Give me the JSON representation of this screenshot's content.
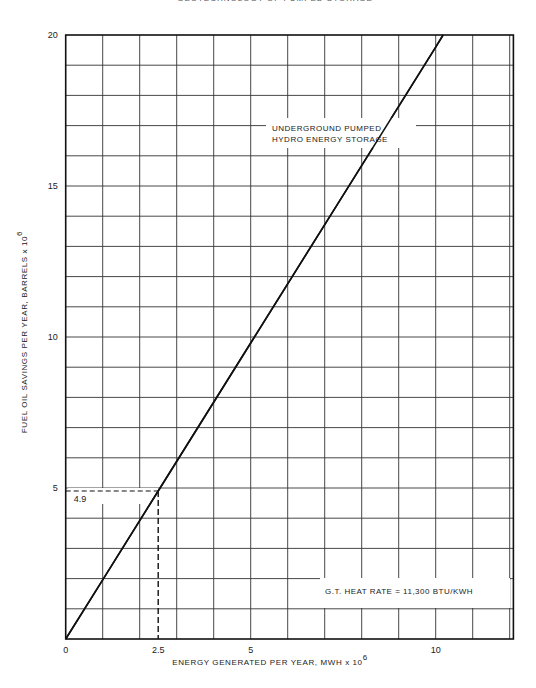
{
  "page": {
    "header": "GEOTECHNOLOGY OF PUMPED STORAGE"
  },
  "chart_data": {
    "type": "line",
    "title": "",
    "xlabel": "ENERGY GENERATED PER YEAR, MWH x 10",
    "xlabel_exp": "6",
    "ylabel": "FUEL OIL SAVINGS PER YEAR, BARRELS x 10",
    "ylabel_exp": "6",
    "xlim": [
      0,
      12.1
    ],
    "ylim": [
      0,
      20
    ],
    "x_ticks": [
      {
        "value": 0,
        "label": "0"
      },
      {
        "value": 2.5,
        "label": "2.5"
      },
      {
        "value": 5,
        "label": "5"
      },
      {
        "value": 10,
        "label": "10"
      }
    ],
    "y_ticks": [
      {
        "value": 0,
        "label": ""
      },
      {
        "value": 5,
        "label": "5"
      },
      {
        "value": 10,
        "label": "10"
      },
      {
        "value": 15,
        "label": "15"
      },
      {
        "value": 20,
        "label": "20"
      }
    ],
    "grid": {
      "x_step": 1,
      "y_step": 1,
      "on": true
    },
    "series": [
      {
        "name": "UNDERGROUND PUMPED HYDRO ENERGY STORAGE",
        "x": [
          0,
          1,
          2.5,
          5,
          7.5,
          10,
          10.2
        ],
        "y": [
          0,
          1.96,
          4.9,
          9.8,
          14.7,
          19.6,
          20
        ]
      }
    ],
    "reference_point": {
      "x": 2.5,
      "y": 4.9,
      "label": "4.9",
      "style": "dashed"
    },
    "annotations": [
      {
        "text_lines": [
          "UNDERGROUND PUMPED",
          "HYDRO ENERGY STORAGE"
        ],
        "x": 5.9,
        "y": 17.5
      },
      {
        "text": "G.T. HEAT RATE = 11,300 BTU/KWH",
        "x": 7.2,
        "y": 1.5,
        "boxed": true
      }
    ]
  }
}
